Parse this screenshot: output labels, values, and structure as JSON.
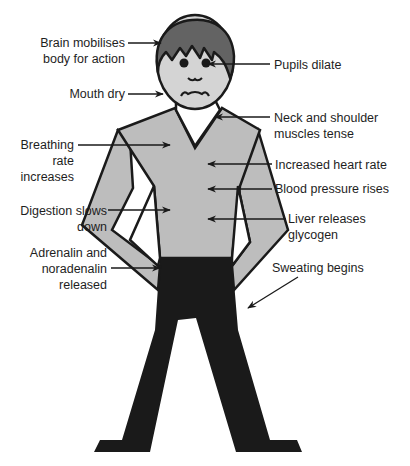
{
  "diagram": {
    "type": "labelled-figure",
    "colors": {
      "hair": "#636363",
      "skin": "#d4d4d4",
      "shirt": "#bdbdbd",
      "trousers": "#1a1a1a",
      "outline": "#1a1a1a",
      "text": "#1e1e1e",
      "background": "#ffffff"
    },
    "labels": {
      "brain": {
        "lines": [
          "Brain mobilises",
          "body for action"
        ]
      },
      "pupils": {
        "lines": [
          "Pupils dilate"
        ]
      },
      "mouth": {
        "lines": [
          "Mouth dry"
        ]
      },
      "neck": {
        "lines": [
          "Neck and shoulder",
          "muscles tense"
        ]
      },
      "breathing": {
        "lines": [
          "Breathing",
          "rate",
          "increases"
        ]
      },
      "heart": {
        "lines": [
          "Increased heart rate"
        ]
      },
      "blood": {
        "lines": [
          "Blood pressure rises"
        ]
      },
      "digestion": {
        "lines": [
          "Digestion slows",
          "down"
        ]
      },
      "liver": {
        "lines": [
          "Liver releases",
          "glycogen"
        ]
      },
      "adrenalin": {
        "lines": [
          "Adrenalin and",
          "noradenalin",
          "released"
        ]
      },
      "sweating": {
        "lines": [
          "Sweating begins"
        ]
      }
    }
  }
}
